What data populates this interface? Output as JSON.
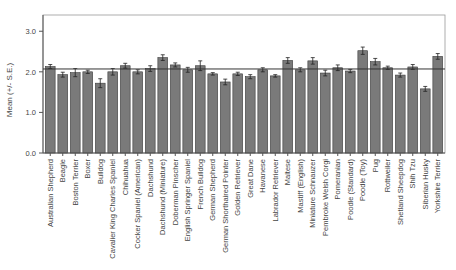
{
  "chart_data": {
    "type": "bar",
    "title": "",
    "xlabel": "",
    "ylabel": "Mean (+/- S.E.)",
    "ylim": [
      0,
      3.4
    ],
    "yticks": [
      "0.0",
      "1.0",
      "2.0",
      "3.0"
    ],
    "grid": false,
    "reference_line": 2.07,
    "error_bars": "standard error",
    "categories": [
      "Australian Shepherd",
      "Beagle",
      "Boston Terrier",
      "Boxer",
      "Bulldog",
      "Cavalier King Charles Spaniel",
      "Chihuahua",
      "Cocker Spaniel (American)",
      "Dachshund",
      "Dachshund (Miniature)",
      "Doberman Pinscher",
      "English Springer Spaniel",
      "French Bulldog",
      "German Shepherd",
      "German Shorthaired Pointer",
      "Golden Retriever",
      "Great Dane",
      "Havanese",
      "Labrador Retriever",
      "Maltese",
      "Mastiff (English)",
      "Miniature Schnauzer",
      "Pembroke Welsh Corgi",
      "Pomeranian",
      "Poodle (Standard)",
      "Poodle (Toy)",
      "Pug",
      "Rottweiler",
      "Shetland Sheepdog",
      "Shih Tzu",
      "Siberian Husky",
      "Yorkshire Terrier"
    ],
    "values": [
      2.13,
      1.93,
      1.98,
      2.0,
      1.72,
      2.0,
      2.15,
      2.0,
      2.08,
      2.35,
      2.17,
      2.05,
      2.15,
      1.95,
      1.75,
      1.95,
      1.88,
      2.05,
      1.9,
      2.28,
      2.05,
      2.27,
      1.97,
      2.1,
      2.02,
      2.52,
      2.25,
      2.1,
      1.92,
      2.12,
      1.58,
      2.38
    ],
    "errors": [
      0.05,
      0.06,
      0.1,
      0.04,
      0.11,
      0.08,
      0.06,
      0.05,
      0.07,
      0.07,
      0.05,
      0.06,
      0.12,
      0.03,
      0.07,
      0.04,
      0.05,
      0.05,
      0.03,
      0.07,
      0.05,
      0.08,
      0.07,
      0.07,
      0.04,
      0.09,
      0.08,
      0.04,
      0.05,
      0.06,
      0.06,
      0.07
    ],
    "colors": {
      "bar": "#7a7a7a",
      "bar_edge": "#3a3a3a",
      "axis": "#555555",
      "reference_line": "#333333",
      "frame": "#999999"
    }
  }
}
